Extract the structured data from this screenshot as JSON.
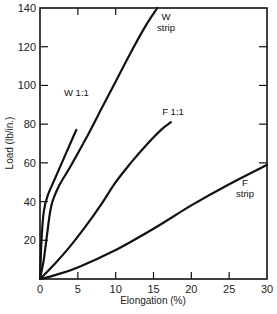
{
  "chart_data": {
    "type": "line",
    "title": "",
    "xlabel": "Elongation (%)",
    "ylabel": "Load (lb/in.)",
    "xlim": [
      0,
      30
    ],
    "ylim": [
      0,
      140
    ],
    "xticks": [
      0,
      5,
      10,
      15,
      20,
      25,
      30
    ],
    "yticks": [
      0,
      20,
      40,
      60,
      80,
      100,
      120,
      140
    ],
    "grid": false,
    "legend": "none (labels placed at curve ends)",
    "series": [
      {
        "name": "W 1:1",
        "label_lines": [
          "W 1:1"
        ],
        "x": [
          0,
          0.2,
          0.5,
          1,
          2,
          3,
          4,
          4.8
        ],
        "y": [
          0,
          20,
          35,
          43,
          52,
          61,
          70,
          77
        ]
      },
      {
        "name": "W strip",
        "label_lines": [
          "W",
          "strip"
        ],
        "x": [
          0,
          0.5,
          1,
          1.5,
          2.5,
          4,
          6,
          8,
          10,
          12,
          14,
          15.5
        ],
        "y": [
          0,
          10,
          25,
          38,
          48,
          58,
          72,
          87,
          102,
          117,
          131,
          140
        ]
      },
      {
        "name": "F 1:1",
        "label_lines": [
          "F 1:1"
        ],
        "x": [
          0,
          2,
          4,
          6,
          8,
          10,
          12,
          14,
          16,
          17.3
        ],
        "y": [
          0,
          8,
          17,
          27,
          38,
          50,
          60,
          69,
          77,
          81
        ]
      },
      {
        "name": "F strip",
        "label_lines": [
          "F",
          "strip"
        ],
        "x": [
          0,
          2,
          5,
          10,
          15,
          20,
          25,
          30
        ],
        "y": [
          0,
          2,
          6,
          15,
          26,
          38,
          49,
          59
        ]
      }
    ]
  },
  "layout": {
    "plot": {
      "left": 40,
      "right": 267,
      "top": 8,
      "bottom": 279
    },
    "line_color": "#111111",
    "label_positions": {
      "W 1:1": {
        "x": 64,
        "y": 96,
        "anchor": "start"
      },
      "W strip": {
        "x": 166,
        "y": 20,
        "anchor": "middle"
      },
      "F 1:1": {
        "x": 173,
        "y": 115,
        "anchor": "middle"
      },
      "F strip": {
        "x": 245,
        "y": 186,
        "anchor": "middle"
      }
    }
  }
}
